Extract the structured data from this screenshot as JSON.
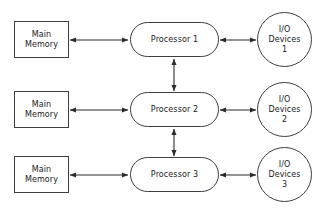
{
  "diagram": {
    "background_color": "#ffffff",
    "stroke_color": "#3d3d3d",
    "text_color": "#1a1a1a",
    "rows": [
      {
        "memory": {
          "line1": "Main",
          "line2": "Memory"
        },
        "processor": {
          "label": "Processor 1"
        },
        "io": {
          "line1": "I/O",
          "line2": "Devices",
          "line3": "1"
        }
      },
      {
        "memory": {
          "line1": "Main",
          "line2": "Memory"
        },
        "processor": {
          "label": "Processor 2"
        },
        "io": {
          "line1": "I/O",
          "line2": "Devices",
          "line3": "2"
        }
      },
      {
        "memory": {
          "line1": "Main",
          "line2": "Memory"
        },
        "processor": {
          "label": "Processor 3"
        },
        "io": {
          "line1": "I/O",
          "line2": "Devices",
          "line3": "3"
        }
      }
    ],
    "connectors": [
      {
        "name": "memory-1-processor-1",
        "kind": "double-arrow",
        "orientation": "horizontal"
      },
      {
        "name": "processor-1-io-1",
        "kind": "double-arrow",
        "orientation": "horizontal"
      },
      {
        "name": "memory-2-processor-2",
        "kind": "double-arrow",
        "orientation": "horizontal"
      },
      {
        "name": "processor-2-io-2",
        "kind": "double-arrow",
        "orientation": "horizontal"
      },
      {
        "name": "memory-3-processor-3",
        "kind": "double-arrow",
        "orientation": "horizontal"
      },
      {
        "name": "processor-3-io-3",
        "kind": "double-arrow",
        "orientation": "horizontal"
      },
      {
        "name": "processor-1-processor-2",
        "kind": "double-arrow",
        "orientation": "vertical"
      },
      {
        "name": "processor-2-processor-3",
        "kind": "double-arrow",
        "orientation": "vertical"
      }
    ]
  }
}
